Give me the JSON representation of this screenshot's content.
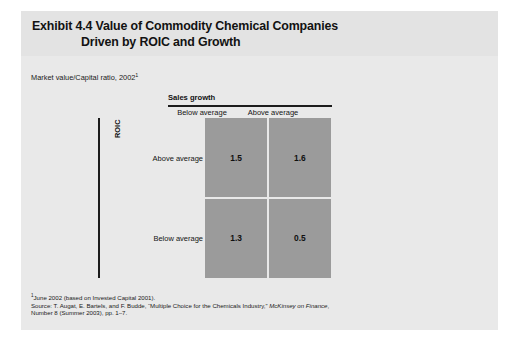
{
  "exhibit": {
    "title_line_1": "Exhibit 4.4 Value of Commodity Chemical Companies",
    "title_line_2": "Driven by ROIC and Growth",
    "subtitle": "Market value/Capital ratio, 2002",
    "subtitle_footnote_marker": "1"
  },
  "chart_data": {
    "type": "heatmap",
    "title": "Exhibit 4.4 Value of Commodity Chemical Companies Driven by ROIC and Growth",
    "subtitle": "Market value/Capital ratio, 2002",
    "xlabel": "Sales growth",
    "ylabel": "ROIC",
    "x_categories": [
      "Below average",
      "Above average"
    ],
    "y_categories": [
      "Above average",
      "Below average"
    ],
    "grid": false,
    "legend": "none",
    "cell_color": "#9b9b9b",
    "cells": [
      {
        "row": "Above average",
        "col": "Below average",
        "value": "1.5"
      },
      {
        "row": "Above average",
        "col": "Above average",
        "value": "1.6"
      },
      {
        "row": "Below average",
        "col": "Below average",
        "value": "1.3"
      },
      {
        "row": "Below average",
        "col": "Above average",
        "value": "0.5"
      }
    ],
    "values": [
      [
        1.5,
        1.6
      ],
      [
        1.3,
        0.5
      ]
    ]
  },
  "footnotes": {
    "marker": "1",
    "line_1": "June 2002 (based on Invested Capital 2001).",
    "line_2_prefix": "Source: T. Augat, E. Bartels, and F. Budde, “Multiple Choice for the Chemicals Industry,” ",
    "line_2_italic": "McKinsey on Finance",
    "line_2_suffix": ",",
    "line_3": "Number 8 (Summer 2003), pp. 1–7."
  }
}
